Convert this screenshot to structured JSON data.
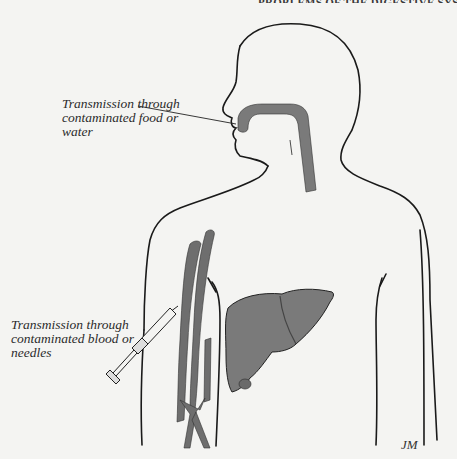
{
  "page": {
    "running_head": "PROBLEMS OF THE DIGESTIVE SYSTEM"
  },
  "figure": {
    "labels": {
      "food_water": {
        "lines": [
          "Transmission through",
          "contaminated food or",
          "water"
        ]
      },
      "blood_needles": {
        "lines": [
          "Transmission through",
          "contaminated blood or",
          "needles"
        ]
      }
    },
    "signature": "JM",
    "colors": {
      "outline": "#1a1a1a",
      "organ_fill": "#7a7a7a",
      "vessel_fill": "#6e6e6e",
      "background": "#f4f4f2"
    },
    "elements": [
      "human-torso-outline",
      "digestive-tract",
      "liver",
      "arm-blood-vessels",
      "syringe"
    ]
  }
}
